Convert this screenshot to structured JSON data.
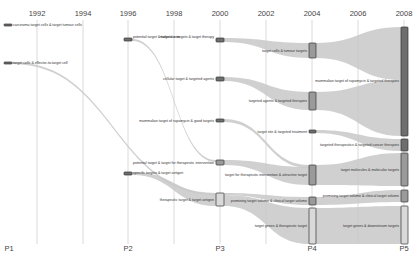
{
  "years": [
    {
      "label": "1992",
      "x": 37
    },
    {
      "label": "1994",
      "x": 83
    },
    {
      "label": "1996",
      "x": 128
    },
    {
      "label": "1998",
      "x": 174
    },
    {
      "label": "2000",
      "x": 220
    },
    {
      "label": "2002",
      "x": 266
    },
    {
      "label": "2004",
      "x": 312
    },
    {
      "label": "2006",
      "x": 358
    },
    {
      "label": "2008",
      "x": 404
    }
  ],
  "periods": [
    {
      "label": "P1",
      "x": 9
    },
    {
      "label": "P2",
      "x": 128
    },
    {
      "label": "P3",
      "x": 220
    },
    {
      "label": "P4",
      "x": 312
    },
    {
      "label": "P5",
      "x": 404
    }
  ],
  "colors": {
    "flow": "#c8c8c8",
    "node_dark": "#6e6e6e",
    "node_mid": "#9a9a9a",
    "node_light": "#d9d9d9",
    "node_border": "#333333",
    "grid": "#d0d0d0"
  },
  "nodes": [
    {
      "id": "p1a",
      "label": "carcinoma target cells & target tumour cells",
      "x": 4,
      "y": 24,
      "w": 8,
      "h": 2,
      "fill": "dark",
      "label_x": 13,
      "label_y": 22.5,
      "align": "l"
    },
    {
      "id": "p1b",
      "label": "target cells & effector-to-target cell",
      "x": 4,
      "y": 62,
      "w": 8,
      "h": 2,
      "fill": "dark",
      "label_x": 13,
      "label_y": 60.5,
      "align": "l"
    },
    {
      "id": "p2a",
      "label": "potential target & targets sum",
      "x": 124,
      "y": 38,
      "w": 8,
      "h": 3,
      "fill": "dark",
      "label_x": 133,
      "label_y": 35,
      "align": "l",
      "label2": "& targets sum"
    },
    {
      "id": "p2b",
      "label": "specific targets & target antigen",
      "x": 124,
      "y": 172,
      "w": 8,
      "h": 3,
      "fill": "dark",
      "label_x": 133,
      "label_y": 171,
      "align": "l"
    },
    {
      "id": "p3a",
      "label": "molecular targets & target therapy",
      "x": 216,
      "y": 38,
      "w": 8,
      "h": 4,
      "fill": "dark",
      "label_x": 214,
      "label_y": 35,
      "align": "r"
    },
    {
      "id": "p3b",
      "label": "cellular target & targeted agents",
      "x": 216,
      "y": 77,
      "w": 8,
      "h": 4,
      "fill": "dark",
      "label_x": 214,
      "label_y": 77,
      "align": "r"
    },
    {
      "id": "p3c",
      "label": "mammalian target of rapamycin & good targets",
      "x": 216,
      "y": 119,
      "w": 8,
      "h": 3,
      "fill": "dark",
      "label_x": 214,
      "label_y": 118.5,
      "align": "r"
    },
    {
      "id": "p3d",
      "label": "potential target & target for therapeutic intervention",
      "x": 216,
      "y": 160,
      "w": 8,
      "h": 5,
      "fill": "mid",
      "label_x": 214,
      "label_y": 160.5,
      "align": "r"
    },
    {
      "id": "p3e",
      "label": "therapeutic target & target antigen",
      "x": 216,
      "y": 193,
      "w": 8,
      "h": 13,
      "fill": "light",
      "label_x": 214,
      "label_y": 197.5,
      "align": "r"
    },
    {
      "id": "p4a",
      "label": "target cells & tumour targets",
      "x": 309,
      "y": 43,
      "w": 7,
      "h": 15,
      "fill": "mid",
      "label_x": 307,
      "label_y": 49,
      "align": "r"
    },
    {
      "id": "p4b",
      "label": "targeted agents & targeted therapies",
      "x": 309,
      "y": 92,
      "w": 7,
      "h": 18,
      "fill": "mid",
      "label_x": 307,
      "label_y": 99,
      "align": "r"
    },
    {
      "id": "p4c",
      "label": "target site & targeted treatment",
      "x": 309,
      "y": 130,
      "w": 7,
      "h": 3,
      "fill": "dark",
      "label_x": 307,
      "label_y": 129.5,
      "align": "r"
    },
    {
      "id": "p4d",
      "label": "target for therapeutic intervention & attractive target",
      "x": 309,
      "y": 165,
      "w": 7,
      "h": 20,
      "fill": "mid",
      "label_x": 307,
      "label_y": 173,
      "align": "r"
    },
    {
      "id": "p4e",
      "label": "promising target volume & clinical target volume",
      "x": 309,
      "y": 197,
      "w": 7,
      "h": 8,
      "fill": "mid",
      "label_x": 307,
      "label_y": 199,
      "align": "r"
    },
    {
      "id": "p4f",
      "label": "target genes & therapeutic target",
      "x": 309,
      "y": 208,
      "w": 7,
      "h": 36,
      "fill": "light",
      "label_x": 307,
      "label_y": 224,
      "align": "r"
    },
    {
      "id": "p5a",
      "label": "mammalian target of rapamycin & targeted therapies",
      "x": 401,
      "y": 27,
      "w": 7,
      "h": 109,
      "fill": "dark",
      "label_x": 399,
      "label_y": 79,
      "align": "r"
    },
    {
      "id": "p5b",
      "label": "targeted therapeutics & targeted cancer therapies",
      "x": 401,
      "y": 139,
      "w": 7,
      "h": 12,
      "fill": "dark",
      "label_x": 399,
      "label_y": 143,
      "align": "r"
    },
    {
      "id": "p5c",
      "label": "target molecules & molecular targets",
      "x": 401,
      "y": 153,
      "w": 7,
      "h": 33,
      "fill": "mid",
      "label_x": 399,
      "label_y": 168,
      "align": "r"
    },
    {
      "id": "p5d",
      "label": "promising target volume & clinical target volume",
      "x": 401,
      "y": 190,
      "w": 7,
      "h": 12,
      "fill": "mid",
      "label_x": 399,
      "label_y": 194,
      "align": "r"
    },
    {
      "id": "p5e",
      "label": "target genes & downstream targets",
      "x": 401,
      "y": 206,
      "w": 7,
      "h": 38,
      "fill": "light",
      "label_x": 399,
      "label_y": 224,
      "align": "r"
    }
  ],
  "flows": [
    {
      "from": "p1b",
      "x1": 12,
      "y1a": 62,
      "y1b": 64,
      "x2": 216,
      "y2a": 193,
      "y2b": 195
    },
    {
      "from": "p2a",
      "x1": 132,
      "y1a": 39,
      "y1b": 41,
      "x2": 216,
      "y2a": 160,
      "y2b": 162
    },
    {
      "from": "p2b",
      "x1": 132,
      "y1a": 172,
      "y1b": 175,
      "x2": 216,
      "y2a": 194,
      "y2b": 206
    },
    {
      "from": "p3a",
      "x1": 224,
      "y1a": 38,
      "y1b": 42,
      "x2": 309,
      "y2a": 43,
      "y2b": 58
    },
    {
      "from": "p3b",
      "x1": 224,
      "y1a": 77,
      "y1b": 81,
      "x2": 309,
      "y2a": 92,
      "y2b": 110
    },
    {
      "from": "p3c",
      "x1": 224,
      "y1a": 119,
      "y1b": 122,
      "x2": 309,
      "y2a": 165,
      "y2b": 168
    },
    {
      "from": "p3d",
      "x1": 224,
      "y1a": 160,
      "y1b": 165,
      "x2": 309,
      "y2a": 167,
      "y2b": 185
    },
    {
      "from": "p3e",
      "x1": 224,
      "y1a": 195,
      "y1b": 206,
      "x2": 309,
      "y2a": 208,
      "y2b": 244
    },
    {
      "from": "p3e2",
      "x1": 224,
      "y1a": 193,
      "y1b": 195,
      "x2": 309,
      "y2a": 197,
      "y2b": 205
    },
    {
      "from": "p4a",
      "x1": 316,
      "y1a": 43,
      "y1b": 58,
      "x2": 401,
      "y2a": 27,
      "y2b": 80
    },
    {
      "from": "p4b",
      "x1": 316,
      "y1a": 92,
      "y1b": 110,
      "x2": 401,
      "y2a": 80,
      "y2b": 136
    },
    {
      "from": "p4c",
      "x1": 316,
      "y1a": 130,
      "y1b": 133,
      "x2": 401,
      "y2a": 139,
      "y2b": 151
    },
    {
      "from": "p4d",
      "x1": 316,
      "y1a": 165,
      "y1b": 185,
      "x2": 401,
      "y2a": 153,
      "y2b": 186
    },
    {
      "from": "p4e",
      "x1": 316,
      "y1a": 197,
      "y1b": 205,
      "x2": 401,
      "y2a": 190,
      "y2b": 202
    },
    {
      "from": "p4f",
      "x1": 316,
      "y1a": 208,
      "y1b": 244,
      "x2": 401,
      "y2a": 206,
      "y2b": 244
    }
  ]
}
